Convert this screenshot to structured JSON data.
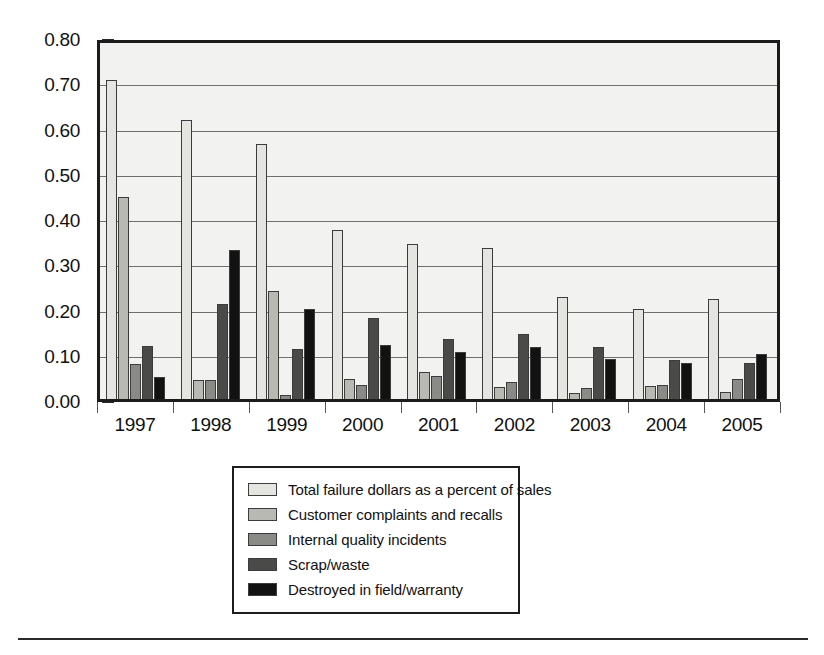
{
  "chart_data": {
    "type": "bar",
    "title": "",
    "xlabel": "",
    "ylabel": "",
    "ylim": [
      0.0,
      0.8
    ],
    "grid": true,
    "legend_position": "bottom",
    "categories": [
      "1997",
      "1998",
      "1999",
      "2000",
      "2001",
      "2002",
      "2003",
      "2004",
      "2005"
    ],
    "ytick_labels": [
      "0.80",
      "0.70",
      "0.60",
      "0.50",
      "0.40",
      "0.30",
      "0.20",
      "0.10",
      "0.00"
    ],
    "ytick_values": [
      0.8,
      0.7,
      0.6,
      0.5,
      0.4,
      0.3,
      0.2,
      0.1,
      0.0
    ],
    "series": [
      {
        "name": "Total failure dollars as a percent of sales",
        "color": "#e4e4e0",
        "values": [
          0.705,
          0.617,
          0.563,
          0.374,
          0.343,
          0.334,
          0.226,
          0.198,
          0.22
        ]
      },
      {
        "name": "Customer complaints and recalls",
        "color": "#b9b9b4",
        "values": [
          0.447,
          0.041,
          0.239,
          0.044,
          0.06,
          0.026,
          0.014,
          0.028,
          0.016
        ]
      },
      {
        "name": "Internal quality incidents",
        "color": "#8a8a86",
        "values": [
          0.077,
          0.043,
          0.008,
          0.032,
          0.051,
          0.038,
          0.024,
          0.03,
          0.045
        ]
      },
      {
        "name": "Scrap/waste",
        "color": "#4a4a48",
        "values": [
          0.118,
          0.209,
          0.111,
          0.18,
          0.132,
          0.143,
          0.114,
          0.087,
          0.08
        ]
      },
      {
        "name": "Destroyed in field/warranty",
        "color": "#121212",
        "values": [
          0.048,
          0.33,
          0.199,
          0.12,
          0.105,
          0.114,
          0.089,
          0.08,
          0.1
        ]
      }
    ]
  },
  "legend": {
    "items": [
      {
        "label": "Total failure dollars as a percent of sales",
        "swatch": "legend-swatch-total-failure-dollars"
      },
      {
        "label": "Customer complaints and recalls",
        "swatch": "legend-swatch-customer-complaints"
      },
      {
        "label": "Internal quality incidents",
        "swatch": "legend-swatch-internal-quality"
      },
      {
        "label": "Scrap/waste",
        "swatch": "legend-swatch-scrap-waste"
      },
      {
        "label": "Destroyed in field/warranty",
        "swatch": "legend-swatch-destroyed-in-field"
      }
    ]
  }
}
